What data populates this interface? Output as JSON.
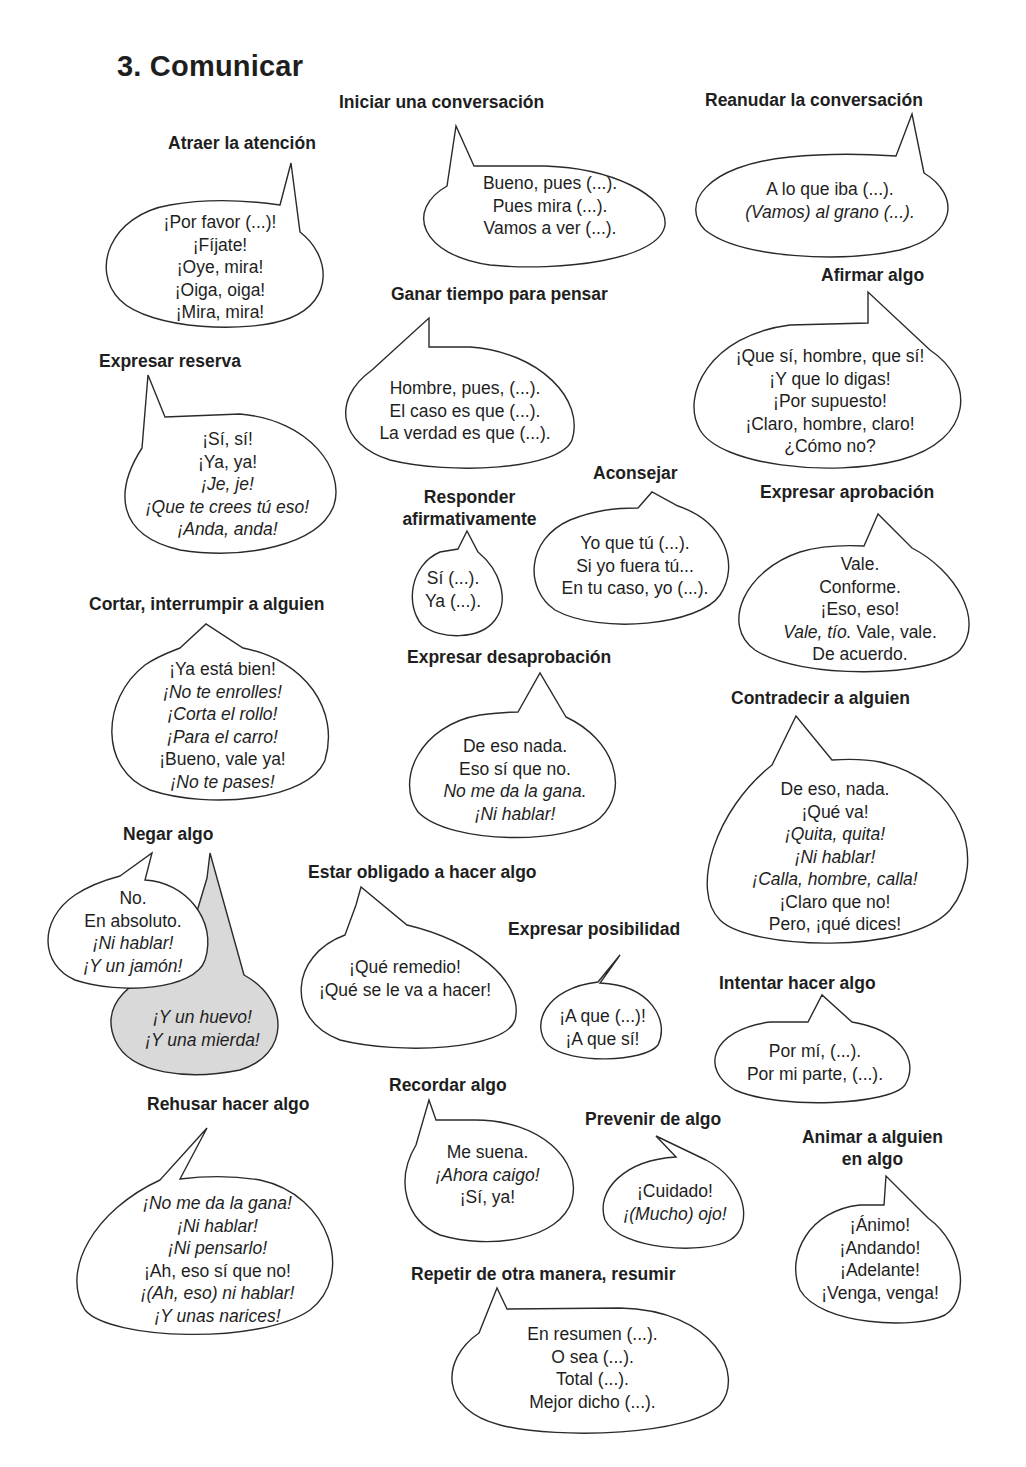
{
  "page": {
    "title": "3. Comunicar"
  },
  "colors": {
    "text": "#1e1e1e",
    "bubble_fill": "#ffffff",
    "bubble_stroke": "#2a2a2a",
    "shaded_bubble_fill": "#d9d9d9"
  },
  "sections": {
    "atraer": {
      "heading": "Atraer la atención",
      "lines": [
        {
          "text": "¡Por favor (...)!",
          "italic": false
        },
        {
          "text": "¡Fíjate!",
          "italic": false
        },
        {
          "text": "¡Oye, mira!",
          "italic": false
        },
        {
          "text": "¡Oiga, oiga!",
          "italic": false
        },
        {
          "text": "¡Mira, mira!",
          "italic": false
        }
      ]
    },
    "iniciar": {
      "heading": "Iniciar una conversación",
      "lines": [
        {
          "text": "Bueno, pues (...).",
          "italic": false
        },
        {
          "text": "Pues mira (...).",
          "italic": false
        },
        {
          "text": "Vamos a ver (...).",
          "italic": false
        }
      ]
    },
    "reanudar": {
      "heading": "Reanudar la conversación",
      "lines": [
        {
          "text": "A lo que iba (...).",
          "italic": false
        },
        {
          "text": "(Vamos) al grano (...).",
          "italic": true
        }
      ]
    },
    "ganar": {
      "heading": "Ganar tiempo para pensar",
      "lines": [
        {
          "text": "Hombre, pues, (...).",
          "italic": false
        },
        {
          "text": "El caso es que (...).",
          "italic": false
        },
        {
          "text": "La verdad es que (...).",
          "italic": false
        }
      ]
    },
    "afirmar": {
      "heading": "Afirmar algo",
      "lines": [
        {
          "text": "¡Que sí, hombre, que sí!",
          "italic": false
        },
        {
          "text": "¡Y que lo digas!",
          "italic": false
        },
        {
          "text": "¡Por supuesto!",
          "italic": false
        },
        {
          "text": "¡Claro, hombre, claro!",
          "italic": false
        },
        {
          "text": "¿Cómo no?",
          "italic": false
        }
      ]
    },
    "reserva": {
      "heading": "Expresar reserva",
      "lines": [
        {
          "text": "¡Sí, sí!",
          "italic": false
        },
        {
          "text": "¡Ya, ya!",
          "italic": false
        },
        {
          "text": "¡Je, je!",
          "italic": true
        },
        {
          "text": "¡Que te crees tú eso!",
          "italic": true
        },
        {
          "text": "¡Anda, anda!",
          "italic": true
        }
      ]
    },
    "responder": {
      "heading_line1": "Responder",
      "heading_line2": "afirmativamente",
      "lines": [
        {
          "text": "Sí (...).",
          "italic": false
        },
        {
          "text": "Ya (...).",
          "italic": false
        }
      ]
    },
    "aconsejar": {
      "heading": "Aconsejar",
      "lines": [
        {
          "text": "Yo que tú (...).",
          "italic": false
        },
        {
          "text": "Si yo fuera tú...",
          "italic": false
        },
        {
          "text": "En tu caso, yo (...).",
          "italic": false
        }
      ]
    },
    "aprobacion": {
      "heading": "Expresar aprobación",
      "lines": [
        {
          "text": "Vale.",
          "italic": false
        },
        {
          "text": "Conforme.",
          "italic": false
        },
        {
          "text": "¡Eso, eso!",
          "italic": false
        }
      ],
      "mixed_line": {
        "italic_part": "Vale, tío.",
        "normal_part": " Vale, vale."
      },
      "last_line": "De acuerdo."
    },
    "cortar": {
      "heading": "Cortar, interrumpir a alguien",
      "lines": [
        {
          "text": "¡Ya está bien!",
          "italic": false
        },
        {
          "text": "¡No te enrolles!",
          "italic": true
        },
        {
          "text": "¡Corta el rollo!",
          "italic": true
        },
        {
          "text": "¡Para el carro!",
          "italic": true
        },
        {
          "text": "¡Bueno, vale ya!",
          "italic": false
        },
        {
          "text": "¡No te pases!",
          "italic": true
        }
      ]
    },
    "desaprobacion": {
      "heading": "Expresar desaprobación",
      "lines": [
        {
          "text": "De eso nada.",
          "italic": false
        },
        {
          "text": "Eso sí que no.",
          "italic": false
        },
        {
          "text": "No me da la gana.",
          "italic": true
        },
        {
          "text": "¡Ni hablar!",
          "italic": true
        }
      ]
    },
    "contradecir": {
      "heading": "Contradecir a alguien",
      "lines": [
        {
          "text": "De eso, nada.",
          "italic": false
        },
        {
          "text": "¡Qué va!",
          "italic": false
        },
        {
          "text": "¡Quita, quita!",
          "italic": true
        },
        {
          "text": "¡Ni hablar!",
          "italic": true
        },
        {
          "text": "¡Calla, hombre, calla!",
          "italic": true
        },
        {
          "text": "¡Claro que no!",
          "italic": false
        },
        {
          "text": "Pero, ¡qué dices!",
          "italic": false
        }
      ]
    },
    "negar": {
      "heading": "Negar algo",
      "lines": [
        {
          "text": "No.",
          "italic": false
        },
        {
          "text": "En absoluto.",
          "italic": false
        },
        {
          "text": "¡Ni hablar!",
          "italic": true
        },
        {
          "text": "¡Y un jamón!",
          "italic": true
        }
      ],
      "vulgar_lines": [
        {
          "text": "¡Y un huevo!",
          "italic": true
        },
        {
          "text": "¡Y una mierda!",
          "italic": true
        }
      ]
    },
    "obligado": {
      "heading": "Estar obligado a hacer algo",
      "lines": [
        {
          "text": "¡Qué remedio!",
          "italic": false
        },
        {
          "text": "¡Qué se le va a hacer!",
          "italic": false
        }
      ]
    },
    "posibilidad": {
      "heading": "Expresar posibilidad",
      "lines": [
        {
          "text": "¡A que (...)!",
          "italic": false
        },
        {
          "text": "¡A que sí!",
          "italic": false
        }
      ]
    },
    "intentar": {
      "heading": "Intentar hacer algo",
      "lines": [
        {
          "text": "Por mí, (...).",
          "italic": false
        },
        {
          "text": "Por mi parte, (...).",
          "italic": false
        }
      ]
    },
    "rehusar": {
      "heading": "Rehusar hacer algo",
      "lines": [
        {
          "text": "¡No me da la gana!",
          "italic": true
        },
        {
          "text": "¡Ni hablar!",
          "italic": true
        },
        {
          "text": "¡Ni pensarlo!",
          "italic": true
        },
        {
          "text": "¡Ah, eso sí que no!",
          "italic": false
        },
        {
          "text": "¡(Ah, eso) ni hablar!",
          "italic": true
        },
        {
          "text": "¡Y unas narices!",
          "italic": true
        }
      ]
    },
    "recordar": {
      "heading": "Recordar algo",
      "lines": [
        {
          "text": "Me suena.",
          "italic": false
        },
        {
          "text": "¡Ahora caigo!",
          "italic": true
        },
        {
          "text": "¡Sí, ya!",
          "italic": false
        }
      ]
    },
    "prevenir": {
      "heading": "Prevenir de algo",
      "lines": [
        {
          "text": "¡Cuidado!",
          "italic": false
        },
        {
          "text": "¡(Mucho) ojo!",
          "italic": true
        }
      ]
    },
    "animar": {
      "heading_line1": "Animar a alguien",
      "heading_line2": "en algo",
      "lines": [
        {
          "text": "¡Ánimo!",
          "italic": false
        },
        {
          "text": "¡Andando!",
          "italic": false
        },
        {
          "text": "¡Adelante!",
          "italic": false
        },
        {
          "text": "¡Venga, venga!",
          "italic": false
        }
      ]
    },
    "repetir": {
      "heading": "Repetir de otra manera, resumir",
      "lines": [
        {
          "text": "En resumen (...).",
          "italic": false
        },
        {
          "text": "O sea (...).",
          "italic": false
        },
        {
          "text": "Total (...).",
          "italic": false
        },
        {
          "text": "Mejor dicho (...).",
          "italic": false
        }
      ]
    }
  }
}
